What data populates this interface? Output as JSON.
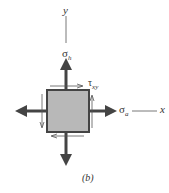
{
  "diagram": {
    "type": "stress-element",
    "axis_y_label": "y",
    "axis_x_label": "x",
    "sigma_h": {
      "symbol": "σ",
      "subscript": "h"
    },
    "sigma_a": {
      "symbol": "σ",
      "subscript": "a"
    },
    "tau_xy": {
      "symbol": "τ",
      "subscript": "xy"
    },
    "caption": "(b)",
    "colors": {
      "element_fill": "#b8b8b8",
      "element_border": "#444444",
      "arrow": "#444444",
      "axis_line": "#555555",
      "text": "#333333"
    }
  }
}
